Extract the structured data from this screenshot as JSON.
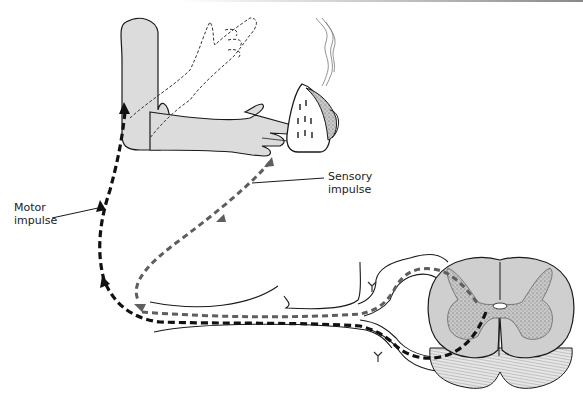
{
  "diagram": {
    "type": "reflex-arc-illustration",
    "labels": {
      "motor": [
        "Motor",
        "impulse"
      ],
      "sensory": [
        "Sensory",
        "impulse"
      ]
    },
    "elements": [
      "arm",
      "hand (withdrawn, dashed outline)",
      "hot iron with steam",
      "sensory nerve path (gray dashed)",
      "motor nerve path (black dashed)",
      "spinal cord cross-section",
      "dorsal root ganglion"
    ],
    "colors": {
      "skin": "#dcdcdc",
      "outline": "#1a1a1a",
      "sensory_path": "#606060",
      "motor_path": "#111111",
      "cord_fill": "#cfcfcf",
      "gray_matter": "#b5b5b5"
    }
  }
}
